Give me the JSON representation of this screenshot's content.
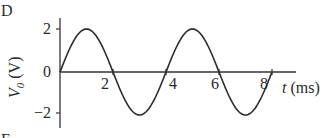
{
  "panel_label": "D",
  "next_panel_label_partial": "E",
  "chart_data": {
    "type": "line",
    "title": "",
    "xlabel": "t (ms)",
    "ylabel": "V0 (V)",
    "xlim": [
      0,
      8.6
    ],
    "ylim": [
      -2.5,
      2.5
    ],
    "x_ticks": [
      "2",
      "4",
      "6",
      "8"
    ],
    "y_ticks": [
      "2",
      "0",
      "-2"
    ],
    "grid": false,
    "legend": null,
    "series": [
      {
        "name": "V0(t) = 2 sin(2π t / 4)",
        "amplitude": 2,
        "period_ms": 4,
        "x": [
          0,
          0.5,
          1,
          1.5,
          2,
          2.5,
          3,
          3.5,
          4,
          4.5,
          5,
          5.5,
          6,
          6.5,
          7,
          7.5,
          8
        ],
        "values": [
          0,
          1.41,
          2,
          1.41,
          0,
          -1.41,
          -2,
          -1.41,
          0,
          1.41,
          2,
          1.41,
          0,
          -1.41,
          -2,
          -1.41,
          0
        ]
      }
    ]
  },
  "axis": {
    "x_label_var": "t",
    "x_label_unit": " (ms)",
    "y_label_var": "V",
    "y_label_sub": "0",
    "y_label_unit": " (V)",
    "tick_2": "2",
    "tick_4": "4",
    "tick_6": "6",
    "tick_8": "8",
    "ytick_pos2": "2",
    "ytick_0": "0",
    "ytick_neg2": "−2"
  }
}
